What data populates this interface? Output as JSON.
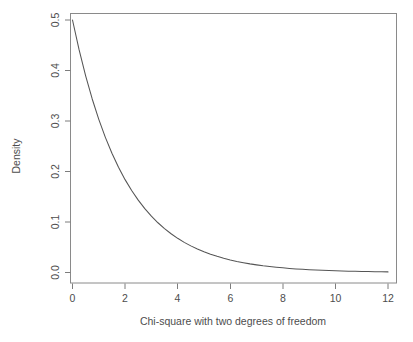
{
  "chart_data": {
    "type": "line",
    "title": "",
    "subtitle": "",
    "xlabel": "Chi-square with two degrees of freedom",
    "ylabel": "Density",
    "xlim": [
      -0.2,
      12.4
    ],
    "ylim": [
      -0.012,
      0.52
    ],
    "xticks": [
      0,
      2,
      4,
      6,
      8,
      10,
      12
    ],
    "xtick_labels": [
      "0",
      "2",
      "4",
      "6",
      "8",
      "10",
      "12"
    ],
    "yticks": [
      0.0,
      0.1,
      0.2,
      0.3,
      0.4,
      0.5
    ],
    "ytick_labels": [
      "0.0",
      "0.1",
      "0.2",
      "0.3",
      "0.4",
      "0.5"
    ],
    "grid": false,
    "legend": null,
    "legend_position": "none",
    "annotations": [],
    "series": [
      {
        "name": "Chi-square df=2 density",
        "formula": "f(x) = 0.5 * exp(-x/2)",
        "color": "#555555",
        "x": [
          0.0,
          0.25,
          0.5,
          0.75,
          1.0,
          1.25,
          1.5,
          1.75,
          2.0,
          2.25,
          2.5,
          2.75,
          3.0,
          3.25,
          3.5,
          3.75,
          4.0,
          4.25,
          4.5,
          4.75,
          5.0,
          5.25,
          5.5,
          5.75,
          6.0,
          6.25,
          6.5,
          6.75,
          7.0,
          7.25,
          7.5,
          7.75,
          8.0,
          8.25,
          8.5,
          8.75,
          9.0,
          9.25,
          9.5,
          9.75,
          10.0,
          10.25,
          10.5,
          10.75,
          11.0,
          11.25,
          11.5,
          11.75,
          12.0
        ],
        "y": [
          0.5,
          0.4412,
          0.3894,
          0.3436,
          0.3033,
          0.2676,
          0.2362,
          0.2084,
          0.1839,
          0.1623,
          0.1433,
          0.1264,
          0.1116,
          0.0985,
          0.0869,
          0.0767,
          0.0677,
          0.0597,
          0.0527,
          0.0465,
          0.041,
          0.0362,
          0.032,
          0.0282,
          0.0249,
          0.022,
          0.0194,
          0.0171,
          0.0151,
          0.0133,
          0.0118,
          0.0104,
          0.0092,
          0.0081,
          0.0071,
          0.0063,
          0.0056,
          0.0049,
          0.0043,
          0.0038,
          0.0034,
          0.003,
          0.0026,
          0.0023,
          0.002,
          0.0018,
          0.0016,
          0.0014,
          0.0012
        ]
      }
    ]
  },
  "axes": {
    "x_title": "Chi-square with two degrees of freedom",
    "y_title": "Density",
    "x_labels": [
      "0",
      "2",
      "4",
      "6",
      "8",
      "10",
      "12"
    ],
    "y_labels": [
      "0.0",
      "0.1",
      "0.2",
      "0.3",
      "0.4",
      "0.5"
    ]
  },
  "colors": {
    "curve": "#555555",
    "axis": "#7d7d7d",
    "frame": "#8a8a8a",
    "text": "#4d4d4d",
    "background": "#ffffff"
  }
}
